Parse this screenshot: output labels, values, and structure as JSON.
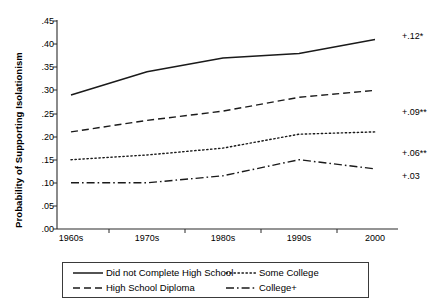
{
  "chart_data": {
    "type": "line",
    "title": "",
    "xlabel": "",
    "ylabel": "Probability of Supporting Isolationism",
    "categories": [
      "1960s",
      "1970s",
      "1980s",
      "1990s",
      "2000"
    ],
    "ylim": [
      0.0,
      0.45
    ],
    "yticks": [
      ".00",
      ".05",
      ".10",
      ".15",
      ".20",
      ".25",
      ".30",
      ".35",
      ".40",
      ".45"
    ],
    "ytick_values": [
      0.0,
      0.05,
      0.1,
      0.15,
      0.2,
      0.25,
      0.3,
      0.35,
      0.4,
      0.45
    ],
    "grid": false,
    "legend_position": "below-plot",
    "series": [
      {
        "name": "Did not Complete High School",
        "style": "solid",
        "values": [
          0.29,
          0.34,
          0.37,
          0.38,
          0.41
        ],
        "annotation": "+.12*"
      },
      {
        "name": "High School Diploma",
        "style": "dashed",
        "values": [
          0.21,
          0.235,
          0.255,
          0.285,
          0.3
        ],
        "annotation": "+.09**"
      },
      {
        "name": "Some College",
        "style": "dotted",
        "values": [
          0.15,
          0.16,
          0.175,
          0.205,
          0.21
        ],
        "annotation": "+.06**"
      },
      {
        "name": "College+",
        "style": "dash-dot",
        "values": [
          0.1,
          0.1,
          0.115,
          0.15,
          0.13
        ],
        "annotation": "+.03"
      }
    ]
  },
  "axis": {
    "ylabel": "Probability of Supporting Isolationism",
    "yticks": [
      ".45",
      ".40",
      ".35",
      ".30",
      ".25",
      ".20",
      ".15",
      ".10",
      ".05",
      ".00"
    ],
    "xticks": [
      "1960s",
      "1970s",
      "1980s",
      "1990s",
      "2000"
    ]
  },
  "annotations": {
    "a0": "+.12*",
    "a1": "+.09**",
    "a2": "+.06**",
    "a3": "+.03"
  },
  "legend": {
    "items": [
      {
        "label": "Did not Complete High School",
        "style": "solid"
      },
      {
        "label": "High School Diploma",
        "style": "dashed"
      },
      {
        "label": "Some College",
        "style": "dotted"
      },
      {
        "label": "College+",
        "style": "dash-dot"
      }
    ]
  },
  "colors": {
    "line": "#1a1a1a",
    "axis": "#2b2b2b",
    "background": "#ffffff"
  }
}
